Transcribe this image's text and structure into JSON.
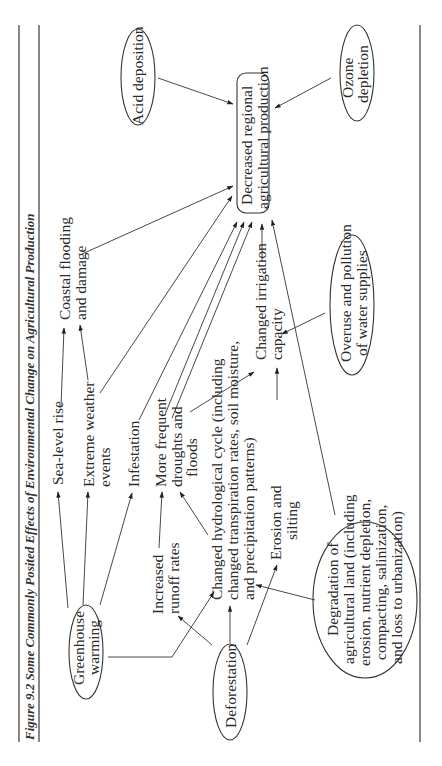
{
  "figure": {
    "title": "Figure 9.2  Some Commonly Posited Effects of Environmental Change on Agricultural Production",
    "orientation": "rotated 90° counter-clockwise"
  },
  "nodes": {
    "central": [
      "Decreased regional",
      "agricultural production"
    ],
    "acid": [
      "Acid deposition"
    ],
    "ozone": [
      "Ozone",
      "depletion"
    ],
    "coastal": [
      "Coastal flooding",
      "and damage"
    ],
    "irrigation": [
      "Changed irrigation",
      "capacity"
    ],
    "overuse": [
      "Overuse and pollution",
      "of water supplies"
    ],
    "sealevel": [
      "Sea-level rise"
    ],
    "extreme": [
      "Extreme weather",
      "events"
    ],
    "infestation": [
      "Infestation"
    ],
    "droughts": [
      "More frequent",
      "droughts and",
      "floods"
    ],
    "hydro": [
      "Changed hydrological cycle (including",
      "changed transpiration rates, soil moisture,",
      "and precipitation patterns)"
    ],
    "erosion": [
      "Erosion and",
      "silting"
    ],
    "runoff": [
      "Increased",
      "runoff rates"
    ],
    "greenhouse": [
      "Greenhouse",
      "warming"
    ],
    "deforestation": [
      "Deforestation"
    ],
    "degradation": [
      "Degradation of",
      "agricultural land (including",
      "erosion, nutrient depletion,",
      "compacting, salinization,",
      "and loss to urbanization)"
    ]
  },
  "edges": [
    [
      "Acid deposition",
      "Decreased regional agricultural production"
    ],
    [
      "Ozone depletion",
      "Decreased regional agricultural production"
    ],
    [
      "Coastal flooding and damage",
      "Decreased regional agricultural production"
    ],
    [
      "Extreme weather events",
      "Decreased regional agricultural production"
    ],
    [
      "Infestation",
      "Decreased regional agricultural production"
    ],
    [
      "More frequent droughts and floods",
      "Decreased regional agricultural production"
    ],
    [
      "Changed irrigation capacity",
      "Decreased regional agricultural production"
    ],
    [
      "Degradation of agricultural land",
      "Decreased regional agricultural production"
    ],
    [
      "Sea-level rise",
      "Coastal flooding and damage"
    ],
    [
      "Greenhouse warming",
      "Sea-level rise"
    ],
    [
      "Greenhouse warming",
      "Extreme weather events"
    ],
    [
      "Greenhouse warming",
      "Infestation"
    ],
    [
      "Greenhouse warming",
      "Changed hydrological cycle"
    ],
    [
      "Increased runoff rates",
      "More frequent droughts and floods"
    ],
    [
      "Changed hydrological cycle",
      "More frequent droughts and floods"
    ],
    [
      "Changed hydrological cycle",
      "Changed irrigation capacity"
    ],
    [
      "Overuse and pollution of water supplies",
      "Changed irrigation capacity"
    ],
    [
      "Erosion and silting",
      "Changed irrigation capacity"
    ],
    [
      "Deforestation",
      "Increased runoff rates"
    ],
    [
      "Deforestation",
      "Changed hydrological cycle"
    ],
    [
      "Deforestation",
      "Erosion and silting"
    ],
    [
      "Degradation of agricultural land",
      "Changed hydrological cycle"
    ]
  ]
}
